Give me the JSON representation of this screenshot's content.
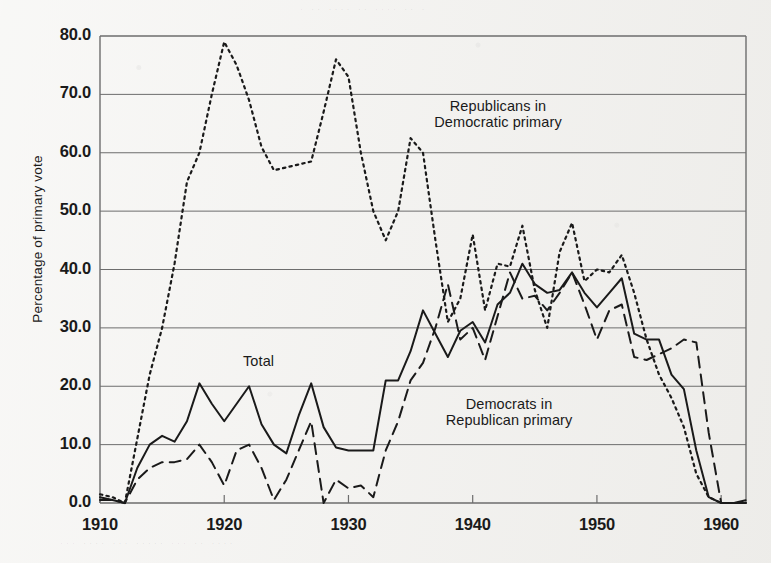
{
  "figure": {
    "background_color": "#f2f1ee",
    "ink_color": "#1a1a1a",
    "grid_color": "#6d6d6d"
  },
  "axis": {
    "y_title": "Percentage of primary vote",
    "y_ticks": [
      "0.0",
      "10.0",
      "20.0",
      "30.0",
      "40.0",
      "50.0",
      "60.0",
      "70.0",
      "80.0"
    ],
    "x_ticks": [
      "1910",
      "1920",
      "1930",
      "1940",
      "1950",
      "1960"
    ]
  },
  "annotations": {
    "total": "Total",
    "republicans": "Republicans in\nDemocratic primary",
    "republicans_line1": "Republicans in",
    "republicans_line2": "Democratic primary",
    "democrats_line1": "Democrats in",
    "democrats_line2": "Republican primary"
  },
  "chart_data": {
    "type": "line",
    "title": "",
    "xlabel": "",
    "ylabel": "Percentage of primary vote",
    "xlim": [
      1910,
      1962
    ],
    "ylim": [
      0,
      80
    ],
    "yticks": [
      0,
      10,
      20,
      30,
      40,
      50,
      60,
      70,
      80
    ],
    "xticks": [
      1910,
      1920,
      1930,
      1940,
      1950,
      1960
    ],
    "grid": "horizontal",
    "legend": "inline-annotations",
    "x": [
      1910,
      1911,
      1912,
      1913,
      1914,
      1915,
      1916,
      1917,
      1918,
      1919,
      1920,
      1921,
      1922,
      1923,
      1924,
      1925,
      1926,
      1927,
      1928,
      1929,
      1930,
      1931,
      1932,
      1933,
      1934,
      1935,
      1936,
      1937,
      1938,
      1939,
      1940,
      1941,
      1942,
      1943,
      1944,
      1945,
      1946,
      1947,
      1948,
      1949,
      1950,
      1951,
      1952,
      1953,
      1954,
      1955,
      1956,
      1957,
      1958,
      1959,
      1960,
      1961,
      1962
    ],
    "series": [
      {
        "name": "Republicans in Democratic primary",
        "style": "dotted",
        "values": [
          1.5,
          1.0,
          0.0,
          11.0,
          22.0,
          30.0,
          41.0,
          55.0,
          60.0,
          70.0,
          79.0,
          75.0,
          69.0,
          61.0,
          57.0,
          57.5,
          58.0,
          58.5,
          67.0,
          76.0,
          73.0,
          60.0,
          50.0,
          45.0,
          50.0,
          62.5,
          60.0,
          45.0,
          31.0,
          35.0,
          46.0,
          33.0,
          41.0,
          40.5,
          47.5,
          36.5,
          30.0,
          43.0,
          48.0,
          38.0,
          40.0,
          39.5,
          42.5,
          36.0,
          28.0,
          22.0,
          18.0,
          13.0,
          5.0,
          1.0,
          0.0,
          0.0,
          0.0
        ]
      },
      {
        "name": "Total",
        "style": "solid",
        "values": [
          1.0,
          0.5,
          0.0,
          6.0,
          10.0,
          11.5,
          10.5,
          14.0,
          20.5,
          17.0,
          14.0,
          17.0,
          20.0,
          13.5,
          10.0,
          8.5,
          15.0,
          20.5,
          13.0,
          9.5,
          9.0,
          9.0,
          9.0,
          21.0,
          21.0,
          26.0,
          33.0,
          29.0,
          25.0,
          29.5,
          31.0,
          27.5,
          34.0,
          36.0,
          41.0,
          37.5,
          36.0,
          36.5,
          39.5,
          36.0,
          33.5,
          36.0,
          38.5,
          29.0,
          28.0,
          28.0,
          22.0,
          19.5,
          9.0,
          1.0,
          0.0,
          0.0,
          0.0
        ]
      },
      {
        "name": "Democrats in Republican primary",
        "style": "dashed",
        "values": [
          0.5,
          0.5,
          0.0,
          4.0,
          6.0,
          7.0,
          7.0,
          7.5,
          10.0,
          7.0,
          3.0,
          9.0,
          10.0,
          6.0,
          0.5,
          4.0,
          9.0,
          14.0,
          0.0,
          4.0,
          2.5,
          3.0,
          1.0,
          9.0,
          14.0,
          21.0,
          24.0,
          30.0,
          37.5,
          28.0,
          30.0,
          24.5,
          32.0,
          39.5,
          35.0,
          35.5,
          33.0,
          36.0,
          39.5,
          34.0,
          28.0,
          33.0,
          34.0,
          25.0,
          24.5,
          25.5,
          26.5,
          28.0,
          27.5,
          12.0,
          0.0,
          0.0,
          0.5
        ]
      }
    ]
  }
}
